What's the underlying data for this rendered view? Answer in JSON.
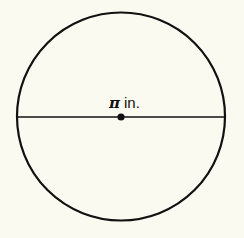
{
  "diagram": {
    "type": "circle-with-diameter",
    "circle": {
      "cx": 121,
      "cy": 116,
      "r": 104
    },
    "diameter_label": {
      "symbol": "π",
      "unit": "in."
    },
    "colors": {
      "background": "#fafaf0",
      "stroke": "#111111"
    }
  }
}
